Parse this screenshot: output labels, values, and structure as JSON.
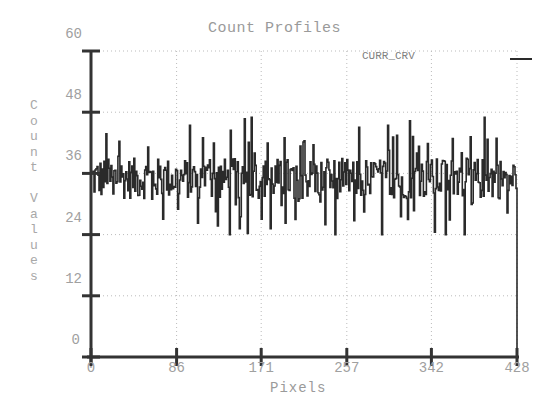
{
  "chart_data": {
    "type": "line",
    "title": "Count Profiles",
    "xlabel": "Pixels",
    "ylabel": "Count Values",
    "xlim": [
      0,
      428
    ],
    "ylim": [
      0,
      60
    ],
    "x_ticks": [
      "0",
      "86",
      "171",
      "257",
      "342",
      "428"
    ],
    "y_ticks": [
      "0",
      "12",
      "24",
      "36",
      "48",
      "60"
    ],
    "grid": true,
    "legend_position": "top-right",
    "series": [
      {
        "name": "CURR_CRV",
        "color": "#2a2a2a",
        "description": "Noisy profile fluctuating between ~27 and ~47 around a mean of ~35, dropping to 0 at pixel 428",
        "mean": 35,
        "min": 24,
        "max": 47,
        "end_value": 0
      }
    ]
  },
  "labels": {
    "title": "Count Profiles",
    "xlabel": "Pixels",
    "ylabel_chars": [
      "C",
      "o",
      "u",
      "n",
      "t",
      "",
      "V",
      "a",
      "l",
      "u",
      "e",
      "s"
    ],
    "legend": "CURR_CRV",
    "y_ticks": [
      "60",
      "48",
      "36",
      "24",
      "12",
      "0"
    ],
    "x_ticks": [
      "0",
      "86",
      "171",
      "257",
      "342",
      "428"
    ]
  },
  "colors": {
    "axis": "#333333",
    "line": "#2a2a2a",
    "grid": "#bbbbbb",
    "text": "#a0a0a0"
  }
}
